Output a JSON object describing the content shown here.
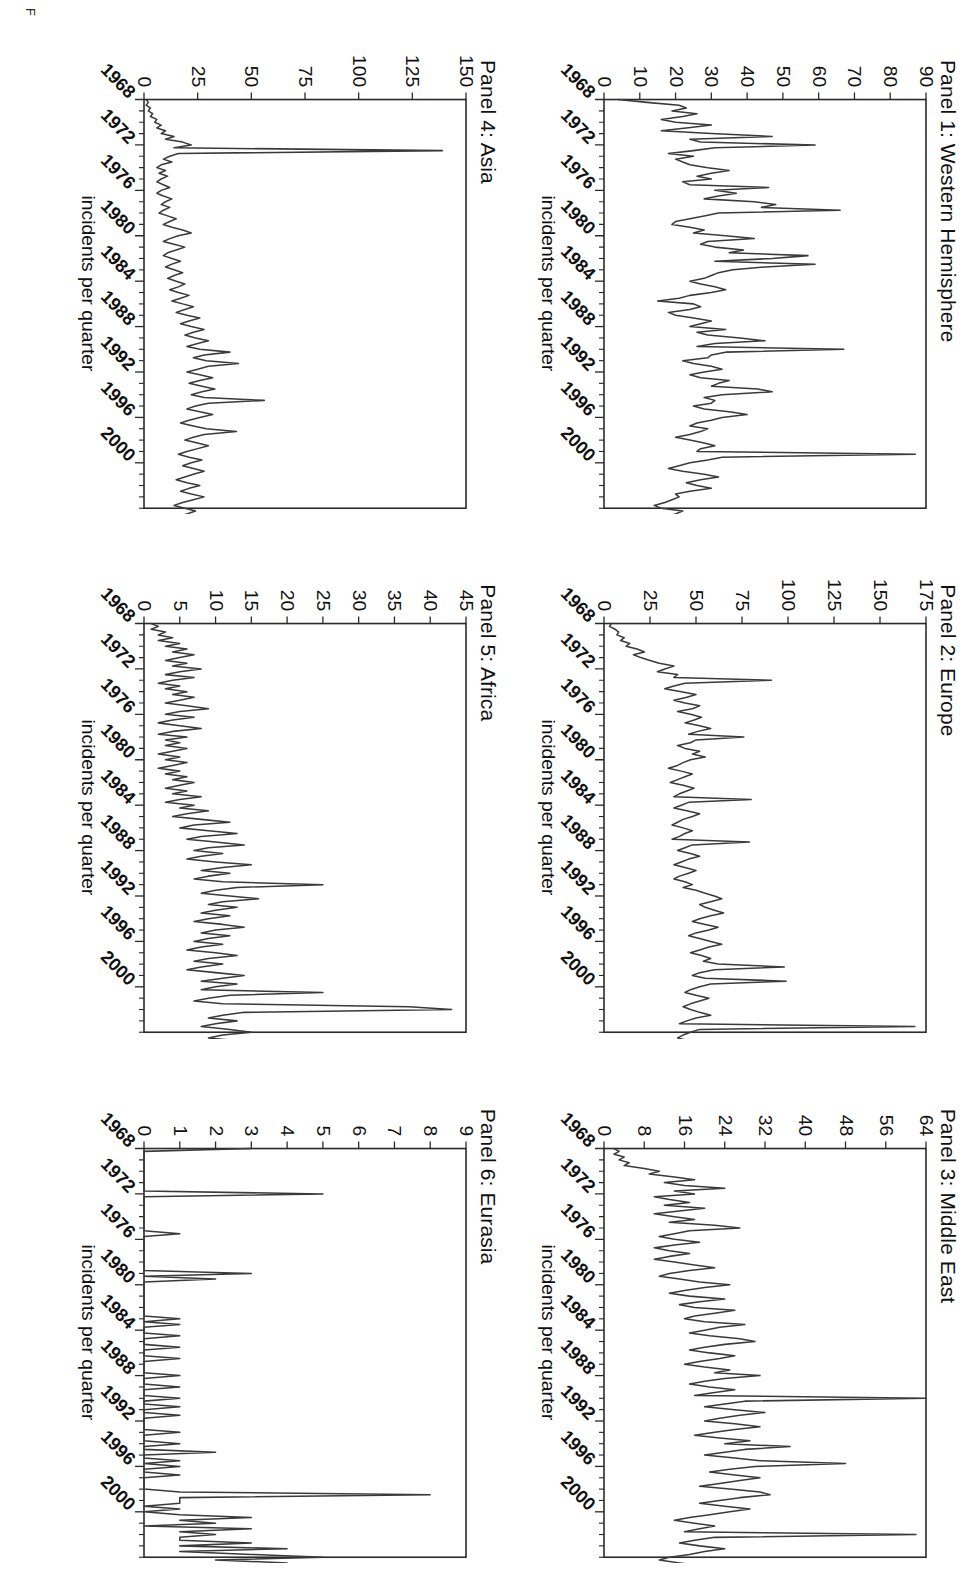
{
  "figure": {
    "caption_partial": "F",
    "y_axis_label": "incidents per quarter",
    "x_tick_labels": [
      "1968",
      "1972",
      "1976",
      "1980",
      "1984",
      "1988",
      "1992",
      "1996",
      "2000"
    ],
    "x_range": [
      1968,
      2004
    ],
    "line_color": "#3a3a3a",
    "axis_color": "#2b2b2b",
    "background": "#ffffff"
  },
  "chart_data": [
    {
      "type": "line",
      "title": "Panel 1: Western Hemisphere",
      "xlabel": "",
      "ylabel": "incidents per quarter",
      "ylim": [
        0,
        90
      ],
      "yticks": [
        0,
        10,
        20,
        30,
        40,
        50,
        60,
        70,
        80,
        90
      ],
      "xlim": [
        1968,
        2004
      ],
      "xticks": [
        1968,
        1972,
        1976,
        1980,
        1984,
        1988,
        1992,
        1996,
        2000
      ],
      "grid": false,
      "legend": "none",
      "x_start": 1968.0,
      "x_step": 0.25,
      "values": [
        4,
        12,
        21,
        23,
        19,
        26,
        22,
        16,
        20,
        30,
        23,
        16,
        30,
        47,
        24,
        27,
        59,
        31,
        25,
        18,
        25,
        20,
        22,
        24,
        29,
        35,
        30,
        26,
        30,
        22,
        24,
        46,
        31,
        37,
        32,
        28,
        42,
        48,
        44,
        66,
        32,
        28,
        24,
        20,
        19,
        24,
        28,
        25,
        34,
        42,
        29,
        27,
        31,
        39,
        35,
        57,
        47,
        31,
        59,
        45,
        36,
        32,
        30,
        28,
        24,
        27,
        31,
        34,
        30,
        24,
        21,
        15,
        25,
        27,
        24,
        18,
        20,
        25,
        30,
        27,
        24,
        34,
        26,
        29,
        38,
        45,
        31,
        26,
        67,
        34,
        30,
        29,
        22,
        25,
        30,
        33,
        28,
        24,
        27,
        35,
        32,
        30,
        43,
        47,
        33,
        28,
        31,
        30,
        25,
        28,
        35,
        40,
        33,
        30,
        26,
        24,
        29,
        27,
        24,
        20,
        24,
        28,
        31,
        27,
        26,
        87,
        33,
        29,
        24,
        21,
        18,
        22,
        28,
        32,
        27,
        23,
        26,
        30,
        24,
        20,
        21,
        19,
        17,
        14,
        16,
        22,
        20,
        18,
        13,
        10,
        12,
        16,
        14,
        11,
        13,
        9,
        8,
        7,
        9,
        34,
        33,
        11,
        8,
        6,
        8,
        12,
        14,
        9,
        7,
        5,
        6,
        7,
        14,
        10,
        6,
        4,
        6,
        5,
        3,
        5,
        7,
        4,
        3,
        5,
        7,
        5,
        3,
        2,
        4,
        3,
        2
      ]
    },
    {
      "type": "line",
      "title": "Panel 2: Europe",
      "xlabel": "",
      "ylabel": "incidents per quarter",
      "ylim": [
        0,
        175
      ],
      "yticks": [
        0,
        25,
        50,
        75,
        100,
        125,
        150,
        175
      ],
      "xlim": [
        1968,
        2004
      ],
      "xticks": [
        1968,
        1972,
        1976,
        1980,
        1984,
        1988,
        1992,
        1996,
        2000
      ],
      "grid": false,
      "legend": "none",
      "x_start": 1968.0,
      "x_step": 0.25,
      "values": [
        4,
        3,
        6,
        8,
        7,
        11,
        9,
        14,
        12,
        18,
        22,
        16,
        20,
        25,
        30,
        38,
        33,
        29,
        40,
        38,
        91,
        44,
        38,
        33,
        42,
        50,
        45,
        38,
        44,
        52,
        48,
        40,
        47,
        53,
        49,
        44,
        52,
        58,
        51,
        46,
        76,
        50,
        47,
        40,
        44,
        52,
        48,
        55,
        47,
        43,
        40,
        35,
        42,
        48,
        44,
        40,
        36,
        43,
        49,
        45,
        41,
        38,
        80,
        46,
        42,
        38,
        45,
        52,
        48,
        43,
        40,
        37,
        43,
        48,
        44,
        41,
        37,
        79,
        48,
        44,
        40,
        47,
        52,
        46,
        42,
        38,
        44,
        50,
        46,
        41,
        38,
        44,
        48,
        43,
        50,
        55,
        60,
        64,
        58,
        52,
        55,
        60,
        65,
        58,
        52,
        48,
        55,
        62,
        57,
        50,
        46,
        52,
        58,
        64,
        57,
        52,
        47,
        53,
        58,
        54,
        62,
        98,
        60,
        52,
        48,
        55,
        99,
        58,
        52,
        47,
        44,
        50,
        57,
        52,
        47,
        43,
        47,
        52,
        58,
        50,
        45,
        41,
        169,
        52,
        47,
        43,
        40,
        46,
        52,
        47,
        43,
        38,
        34,
        30,
        36,
        41,
        37,
        33,
        29,
        34,
        38,
        33,
        29,
        26,
        31,
        36,
        32,
        28,
        24,
        20,
        24,
        28,
        24,
        20,
        17,
        21,
        25,
        21,
        18,
        15,
        12,
        16,
        20,
        17,
        14,
        11,
        9,
        13,
        17,
        14,
        11,
        8,
        6,
        10,
        14,
        11,
        8,
        6,
        4
      ]
    },
    {
      "type": "line",
      "title": "Panel 3: Middle East",
      "xlabel": "",
      "ylabel": "incidents per quarter",
      "ylim": [
        0,
        64
      ],
      "yticks": [
        0,
        8,
        16,
        24,
        32,
        40,
        48,
        56,
        64
      ],
      "xlim": [
        1968,
        2004
      ],
      "xticks": [
        1968,
        1972,
        1976,
        1980,
        1984,
        1988,
        1992,
        1996,
        2000
      ],
      "grid": false,
      "legend": "none",
      "x_start": 1968.0,
      "x_step": 0.25,
      "values": [
        2,
        3,
        2,
        4,
        3,
        5,
        4,
        8,
        11,
        9,
        14,
        18,
        12,
        16,
        24,
        14,
        18,
        10,
        13,
        17,
        12,
        20,
        15,
        10,
        14,
        18,
        13,
        22,
        27,
        17,
        14,
        11,
        14,
        19,
        14,
        10,
        13,
        17,
        13,
        10,
        14,
        18,
        22,
        17,
        13,
        11,
        15,
        19,
        25,
        20,
        16,
        13,
        17,
        24,
        19,
        15,
        18,
        26,
        22,
        18,
        16,
        20,
        28,
        23,
        20,
        17,
        21,
        27,
        30,
        24,
        20,
        17,
        21,
        26,
        23,
        19,
        16,
        20,
        25,
        22,
        31,
        24,
        20,
        17,
        21,
        26,
        22,
        18,
        64,
        28,
        24,
        20,
        26,
        32,
        27,
        23,
        20,
        26,
        31,
        26,
        22,
        18,
        23,
        29,
        24,
        37,
        28,
        24,
        20,
        26,
        31,
        48,
        30,
        25,
        21,
        26,
        31,
        27,
        23,
        19,
        25,
        31,
        33,
        27,
        23,
        19,
        24,
        29,
        25,
        21,
        17,
        14,
        18,
        22,
        19,
        16,
        62,
        22,
        18,
        15,
        19,
        24,
        20,
        17,
        13,
        11,
        15,
        19,
        16,
        13,
        11,
        15,
        20,
        24,
        18,
        15,
        12,
        16,
        21,
        25,
        44,
        20,
        16,
        13,
        17,
        22,
        18,
        15,
        12,
        16,
        20,
        17,
        14,
        11,
        9,
        12,
        16,
        13,
        11,
        9,
        12,
        15,
        12,
        10,
        8,
        11,
        14,
        11,
        9,
        7,
        5,
        34,
        10,
        8,
        6
      ]
    },
    {
      "type": "line",
      "title": "Panel 4: Asia",
      "xlabel": "",
      "ylabel": "incidents per quarter",
      "ylim": [
        0,
        150
      ],
      "yticks": [
        0,
        25,
        50,
        75,
        100,
        125,
        150
      ],
      "xlim": [
        1968,
        2004
      ],
      "xticks": [
        1968,
        1972,
        1976,
        1980,
        1984,
        1988,
        1992,
        1996,
        2000
      ],
      "grid": false,
      "legend": "none",
      "x_start": 1968.0,
      "x_step": 0.25,
      "values": [
        1,
        2,
        1,
        3,
        2,
        4,
        3,
        6,
        5,
        8,
        6,
        10,
        8,
        14,
        10,
        18,
        22,
        14,
        139,
        16,
        12,
        9,
        13,
        8,
        6,
        10,
        7,
        11,
        8,
        6,
        9,
        12,
        8,
        6,
        9,
        13,
        10,
        8,
        12,
        9,
        7,
        11,
        15,
        12,
        9,
        13,
        18,
        22,
        16,
        12,
        9,
        14,
        19,
        15,
        11,
        9,
        13,
        17,
        13,
        10,
        14,
        18,
        14,
        11,
        15,
        19,
        16,
        12,
        16,
        21,
        17,
        13,
        18,
        23,
        19,
        15,
        20,
        26,
        21,
        17,
        22,
        28,
        23,
        19,
        24,
        30,
        25,
        20,
        26,
        40,
        28,
        23,
        29,
        44,
        30,
        25,
        20,
        26,
        32,
        26,
        21,
        27,
        33,
        27,
        22,
        28,
        56,
        30,
        24,
        20,
        26,
        32,
        26,
        21,
        17,
        23,
        29,
        43,
        28,
        23,
        19,
        25,
        30,
        25,
        20,
        16,
        21,
        27,
        22,
        18,
        23,
        28,
        23,
        19,
        15,
        20,
        26,
        21,
        17,
        22,
        28,
        23,
        18,
        14,
        19,
        24,
        20,
        16,
        21,
        26,
        21,
        17,
        13,
        18,
        23,
        19,
        15,
        20,
        25,
        20,
        16,
        12,
        17,
        22,
        18,
        14,
        19,
        24,
        19,
        15,
        11,
        16,
        21,
        17,
        13,
        18,
        38,
        22,
        17,
        13,
        9,
        14,
        19,
        15,
        11,
        16,
        21,
        17,
        13,
        9,
        7
      ]
    },
    {
      "type": "line",
      "title": "Panel 5: Africa",
      "xlabel": "",
      "ylabel": "incidents per quarter",
      "ylim": [
        0,
        45
      ],
      "yticks": [
        0,
        5,
        10,
        15,
        20,
        25,
        30,
        35,
        40,
        45
      ],
      "xlim": [
        1968,
        2004
      ],
      "xticks": [
        1968,
        1972,
        1976,
        1980,
        1984,
        1988,
        1992,
        1996,
        2000
      ],
      "grid": false,
      "legend": "none",
      "x_start": 1968.0,
      "x_step": 0.25,
      "values": [
        1,
        2,
        1,
        3,
        2,
        4,
        2,
        5,
        3,
        6,
        4,
        7,
        5,
        3,
        6,
        4,
        8,
        5,
        3,
        7,
        4,
        2,
        5,
        3,
        6,
        4,
        7,
        5,
        3,
        6,
        9,
        5,
        3,
        7,
        4,
        2,
        5,
        8,
        4,
        2,
        6,
        3,
        5,
        3,
        6,
        4,
        2,
        5,
        3,
        6,
        4,
        2,
        5,
        3,
        6,
        4,
        7,
        5,
        3,
        6,
        4,
        8,
        5,
        3,
        7,
        5,
        9,
        6,
        4,
        8,
        12,
        7,
        5,
        9,
        13,
        8,
        6,
        10,
        14,
        9,
        7,
        11,
        8,
        6,
        10,
        15,
        11,
        8,
        12,
        9,
        7,
        11,
        25,
        13,
        10,
        8,
        12,
        16,
        11,
        9,
        13,
        10,
        8,
        12,
        9,
        7,
        11,
        14,
        10,
        8,
        12,
        9,
        7,
        11,
        8,
        6,
        10,
        13,
        9,
        7,
        11,
        8,
        6,
        10,
        14,
        11,
        8,
        13,
        10,
        8,
        25,
        12,
        9,
        7,
        11,
        37,
        43,
        14,
        11,
        9,
        13,
        10,
        8,
        12,
        15,
        11,
        9,
        13,
        10,
        8,
        12,
        9,
        7,
        11,
        14,
        10,
        8,
        12,
        9,
        7,
        24,
        11,
        8,
        6,
        10,
        13,
        18,
        11,
        8,
        6,
        9,
        7,
        5,
        8,
        6,
        4,
        7,
        5,
        3,
        6,
        4,
        2,
        5,
        3,
        6,
        4,
        2,
        5,
        3,
        4,
        2,
        3,
        2,
        3,
        2
      ]
    },
    {
      "type": "line",
      "title": "Panel 6: Eurasia",
      "xlabel": "",
      "ylabel": "incidents per quarter",
      "ylim": [
        0,
        9
      ],
      "yticks": [
        0,
        1,
        2,
        3,
        4,
        5,
        6,
        7,
        8,
        9
      ],
      "xlim": [
        1968,
        2004
      ],
      "xticks": [
        1968,
        1972,
        1976,
        1980,
        1984,
        1988,
        1992,
        1996,
        2000
      ],
      "grid": false,
      "legend": "none",
      "x_start": 1968.0,
      "x_step": 0.25,
      "values": [
        3,
        0,
        0,
        0,
        0,
        0,
        0,
        0,
        0,
        0,
        0,
        0,
        0,
        0,
        0,
        0,
        5,
        0,
        0,
        0,
        0,
        0,
        0,
        0,
        0,
        0,
        0,
        0,
        0,
        0,
        1,
        0,
        0,
        0,
        0,
        0,
        0,
        0,
        0,
        0,
        0,
        0,
        0,
        0,
        3,
        0,
        2,
        0,
        0,
        0,
        0,
        0,
        0,
        0,
        0,
        0,
        0,
        0,
        0,
        0,
        1,
        0,
        1,
        0,
        0,
        0,
        1,
        0,
        0,
        0,
        1,
        0,
        0,
        0,
        1,
        0,
        0,
        0,
        0,
        0,
        1,
        0,
        0,
        0,
        1,
        0,
        0,
        0,
        1,
        0,
        0,
        1,
        0,
        0,
        1,
        0,
        0,
        0,
        0,
        0,
        1,
        0,
        0,
        0,
        1,
        0,
        0,
        2,
        0,
        0,
        1,
        0,
        1,
        0,
        0,
        1,
        0,
        0,
        0,
        0,
        0,
        1,
        8,
        1,
        1,
        1,
        0,
        1,
        0,
        1,
        3,
        1,
        2,
        0,
        3,
        1,
        2,
        1,
        1,
        3,
        1,
        4,
        1,
        3,
        5,
        2,
        4,
        3,
        9,
        4,
        7,
        3,
        5,
        4,
        6,
        3,
        1,
        5,
        3,
        1,
        7,
        4,
        2,
        6,
        1,
        3,
        2,
        6,
        1,
        4,
        2,
        5,
        1,
        3,
        1,
        2,
        1,
        1,
        2,
        1,
        1,
        2,
        0,
        1,
        2,
        1,
        1,
        1,
        2,
        1,
        0
      ]
    }
  ]
}
